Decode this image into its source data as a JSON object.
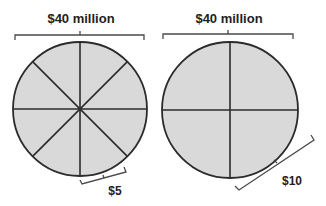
{
  "diagram": {
    "colors": {
      "pie_fill": "#d9d9d9",
      "stroke": "#2b2b2b",
      "bracket": "#4a4a4a",
      "text": "#1e1e1e",
      "background": "#ffffff"
    },
    "pies": [
      {
        "id": "left",
        "total_label": "$40 million",
        "slices": 8,
        "slice_label": "$5",
        "center": [
          80,
          109
        ],
        "radius": 67
      },
      {
        "id": "right",
        "total_label": "$40 million",
        "slices": 4,
        "slice_label": "$10",
        "center": [
          230,
          110
        ],
        "radius": 68
      }
    ]
  }
}
